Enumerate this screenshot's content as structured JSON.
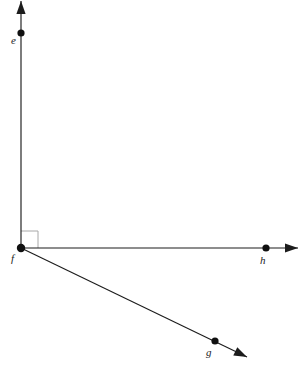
{
  "figure": {
    "background_color": "#ffffff",
    "line_color": "#1c1c1c",
    "marker_color": "#a8a8a8",
    "width": 302,
    "height": 374
  },
  "vertex": {
    "label": "f",
    "x": 21,
    "y": 248,
    "label_x": 11,
    "label_y": 262
  },
  "rays": [
    {
      "name": "ray-fe",
      "direction": "up",
      "from_x": 21,
      "from_y": 248,
      "to_x": 21,
      "to_y": 9,
      "tip_x": 21,
      "tip_y": 1,
      "point": {
        "label": "e",
        "x": 21,
        "y": 33,
        "label_x": 11,
        "label_y": 44
      }
    },
    {
      "name": "ray-fh",
      "direction": "right",
      "from_x": 21,
      "from_y": 248,
      "to_x": 288,
      "to_y": 248,
      "tip_x": 298,
      "tip_y": 248,
      "point": {
        "label": "h",
        "x": 266,
        "y": 248,
        "label_x": 260,
        "label_y": 264
      }
    },
    {
      "name": "ray-fg",
      "direction": "down-right",
      "from_x": 21,
      "from_y": 248,
      "to_x": 237,
      "to_y": 352,
      "tip_x": 247,
      "tip_y": 357,
      "point": {
        "label": "g",
        "x": 215,
        "y": 341,
        "label_x": 206,
        "label_y": 356
      }
    }
  ],
  "right_angle_marker": {
    "name": "right-angle-between-fe-and-fh",
    "x": 21,
    "y": 231,
    "size": 17,
    "color": "#a8a8a8"
  }
}
